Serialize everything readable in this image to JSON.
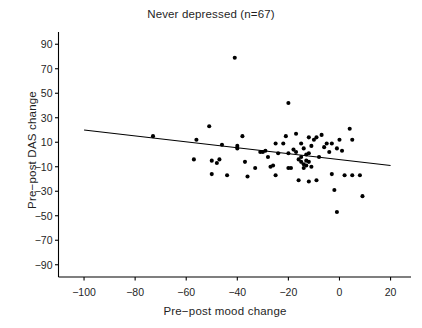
{
  "chart_data": {
    "type": "scatter",
    "title": "Never depressed (n=67)",
    "xlabel": "Pre−post mood change",
    "ylabel": "Pre−post DAS change",
    "xlim": [
      -110,
      28
    ],
    "ylim": [
      -100,
      100
    ],
    "xticks": [
      -100,
      -80,
      -60,
      -40,
      -20,
      0,
      20
    ],
    "xtick_labels": [
      "−100",
      "−80",
      "−60",
      "−40",
      "−20",
      "0",
      "20"
    ],
    "yticks": [
      90,
      70,
      50,
      30,
      10,
      -10,
      -30,
      -50,
      -70,
      -90
    ],
    "ytick_labels": [
      "90",
      "70",
      "50",
      "30",
      "10",
      "−10",
      "−30",
      "−50",
      "−70",
      "−90"
    ],
    "grid": false,
    "legend": null,
    "n": 67,
    "marker_color": "#000000",
    "marker_size": 3.0,
    "line_color": "#000000",
    "axis_color": "#000000",
    "trendline": {
      "label": "regression line",
      "x": [
        -100,
        20
      ],
      "y": [
        20,
        -9
      ]
    },
    "points": [
      [
        -73,
        15
      ],
      [
        -56,
        12
      ],
      [
        -57,
        -4
      ],
      [
        -51,
        23
      ],
      [
        -50,
        -5
      ],
      [
        -50,
        -16
      ],
      [
        -48,
        -7
      ],
      [
        -47,
        -4
      ],
      [
        -46,
        8
      ],
      [
        -44,
        -17
      ],
      [
        -41,
        79
      ],
      [
        -40,
        5
      ],
      [
        -40,
        7
      ],
      [
        -38,
        15
      ],
      [
        -37,
        -6
      ],
      [
        -36,
        -18
      ],
      [
        -33,
        -11
      ],
      [
        -31,
        2
      ],
      [
        -30,
        2
      ],
      [
        -29,
        3
      ],
      [
        -28,
        -2
      ],
      [
        -27,
        -10
      ],
      [
        -26,
        -9
      ],
      [
        -25,
        9
      ],
      [
        -25,
        -17
      ],
      [
        -24,
        1
      ],
      [
        -22,
        9
      ],
      [
        -21,
        15
      ],
      [
        -20,
        42
      ],
      [
        -20,
        1
      ],
      [
        -20,
        -11
      ],
      [
        -19,
        -11
      ],
      [
        -18,
        4
      ],
      [
        -17,
        17
      ],
      [
        -17,
        2
      ],
      [
        -16,
        -4
      ],
      [
        -16,
        -21
      ],
      [
        -15,
        9
      ],
      [
        -15,
        -2
      ],
      [
        -15,
        -6
      ],
      [
        -14,
        5
      ],
      [
        -14,
        -8
      ],
      [
        -14,
        -11
      ],
      [
        -13,
        0
      ],
      [
        -13,
        -5
      ],
      [
        -13,
        -9
      ],
      [
        -12,
        14
      ],
      [
        -12,
        1
      ],
      [
        -12,
        -6
      ],
      [
        -12,
        -22
      ],
      [
        -11,
        7
      ],
      [
        -11,
        -10
      ],
      [
        -10,
        12
      ],
      [
        -9,
        14
      ],
      [
        -9,
        -21
      ],
      [
        -8,
        -2
      ],
      [
        -7,
        16
      ],
      [
        -6,
        6
      ],
      [
        -5,
        9
      ],
      [
        -4,
        2
      ],
      [
        -3,
        9
      ],
      [
        -3,
        -16
      ],
      [
        -2,
        -29
      ],
      [
        -1,
        5
      ],
      [
        -1,
        -47
      ],
      [
        0,
        12
      ],
      [
        1,
        3
      ],
      [
        2,
        -17
      ],
      [
        4,
        21
      ],
      [
        5,
        12
      ],
      [
        5,
        -17
      ],
      [
        8,
        -17
      ],
      [
        9,
        -34
      ]
    ]
  }
}
